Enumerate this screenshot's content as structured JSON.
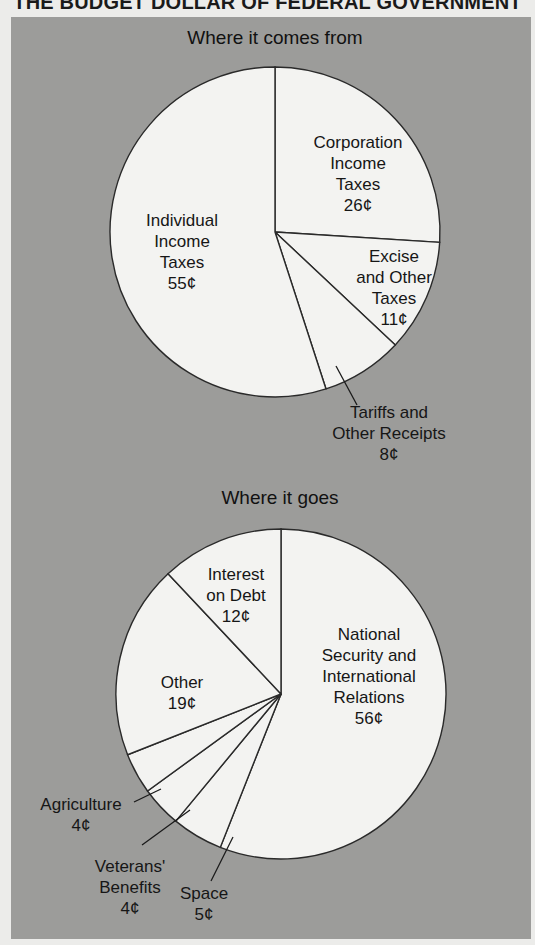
{
  "title": "THE BUDGET DOLLAR OF FEDERAL GOVERNMENT",
  "colors": {
    "panel": "#9c9c9a",
    "slice_fill": "#f3f3f1",
    "stroke": "#2a2a2a"
  },
  "chart_data": [
    {
      "type": "pie",
      "title": "Where it comes from",
      "unit": "¢",
      "start": "top",
      "direction": "clockwise",
      "slices": [
        {
          "name": "Corporation Income Taxes",
          "value": 26,
          "label_lines": [
            "Corporation",
            "Income",
            "Taxes",
            "26¢"
          ],
          "label_position": "inside"
        },
        {
          "name": "Excise and Other Taxes",
          "value": 11,
          "label_lines": [
            "Excise",
            "and Other",
            "Taxes",
            "11¢"
          ],
          "label_position": "inside"
        },
        {
          "name": "Tariffs and Other Receipts",
          "value": 8,
          "label_lines": [
            "Tariffs and",
            "Other Receipts",
            "8¢"
          ],
          "label_position": "outside-leader"
        },
        {
          "name": "Individual Income Taxes",
          "value": 55,
          "label_lines": [
            "Individual",
            "Income",
            "Taxes",
            "55¢"
          ],
          "label_position": "inside"
        }
      ]
    },
    {
      "type": "pie",
      "title": "Where it goes",
      "unit": "¢",
      "start": "top",
      "direction": "clockwise",
      "slices": [
        {
          "name": "National Security and International Relations",
          "value": 56,
          "label_lines": [
            "National",
            "Security and",
            "International",
            "Relations",
            "56¢"
          ],
          "label_position": "inside"
        },
        {
          "name": "Space",
          "value": 5,
          "label_lines": [
            "Space",
            "5¢"
          ],
          "label_position": "outside-leader"
        },
        {
          "name": "Veterans' Benefits",
          "value": 4,
          "label_lines": [
            "Veterans'",
            "Benefits",
            "4¢"
          ],
          "label_position": "outside-leader"
        },
        {
          "name": "Agriculture",
          "value": 4,
          "label_lines": [
            "Agriculture",
            "4¢"
          ],
          "label_position": "outside-leader"
        },
        {
          "name": "Other",
          "value": 19,
          "label_lines": [
            "Other",
            "19¢"
          ],
          "label_position": "inside"
        },
        {
          "name": "Interest on Debt",
          "value": 12,
          "label_lines": [
            "Interest",
            "on Debt",
            "12¢"
          ],
          "label_position": "inside"
        }
      ]
    }
  ]
}
